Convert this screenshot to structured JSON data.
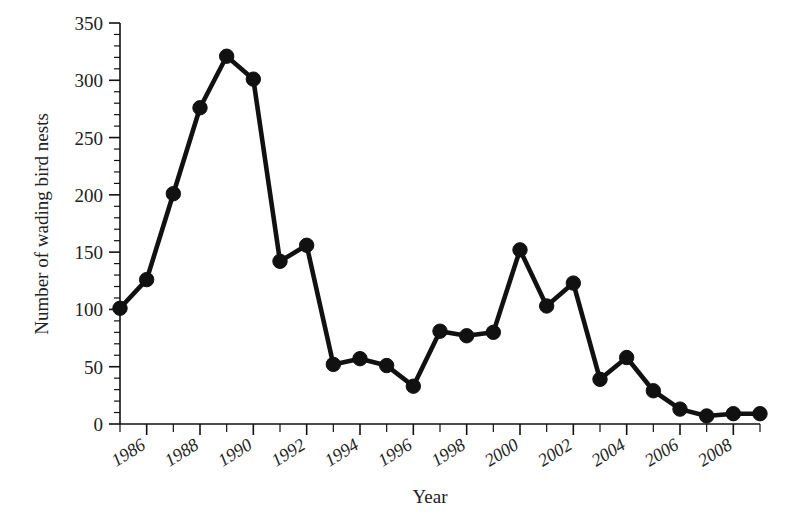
{
  "figure": {
    "background_color": "#ffffff",
    "line_color": "#111111",
    "marker_color": "#111111",
    "text_color": "#222222"
  },
  "axes": {
    "y_title": "Number of wading bird nests",
    "x_title": "Year",
    "y_ticks": [
      "0",
      "50",
      "100",
      "150",
      "200",
      "250",
      "300",
      "350"
    ],
    "x_ticks": [
      "1986",
      "1988",
      "1990",
      "1992",
      "1994",
      "1996",
      "1998",
      "2000",
      "2002",
      "2004",
      "2006",
      "2008"
    ]
  },
  "chart_data": {
    "type": "line",
    "title": "",
    "xlabel": "Year",
    "ylabel": "Number of wading bird nests",
    "xlim": [
      1985,
      2009
    ],
    "ylim": [
      0,
      350
    ],
    "grid": false,
    "legend": null,
    "marker": "filled-circle",
    "x": [
      1985,
      1986,
      1987,
      1988,
      1989,
      1990,
      1991,
      1992,
      1993,
      1994,
      1995,
      1996,
      1997,
      1998,
      1999,
      2000,
      2001,
      2002,
      2003,
      2004,
      2005,
      2006,
      2007,
      2008,
      2009
    ],
    "values": [
      101,
      126,
      201,
      276,
      321,
      301,
      142,
      156,
      52,
      57,
      51,
      33,
      81,
      77,
      80,
      152,
      103,
      123,
      39,
      58,
      29,
      13,
      7,
      9,
      9
    ],
    "points": [
      {
        "year": 1985,
        "nests": 101
      },
      {
        "year": 1986,
        "nests": 126
      },
      {
        "year": 1987,
        "nests": 201
      },
      {
        "year": 1988,
        "nests": 276
      },
      {
        "year": 1989,
        "nests": 321
      },
      {
        "year": 1990,
        "nests": 301
      },
      {
        "year": 1991,
        "nests": 142
      },
      {
        "year": 1992,
        "nests": 156
      },
      {
        "year": 1993,
        "nests": 52
      },
      {
        "year": 1994,
        "nests": 57
      },
      {
        "year": 1995,
        "nests": 51
      },
      {
        "year": 1996,
        "nests": 33
      },
      {
        "year": 1997,
        "nests": 81
      },
      {
        "year": 1998,
        "nests": 77
      },
      {
        "year": 1999,
        "nests": 80
      },
      {
        "year": 2000,
        "nests": 152
      },
      {
        "year": 2001,
        "nests": 103
      },
      {
        "year": 2002,
        "nests": 123
      },
      {
        "year": 2003,
        "nests": 39
      },
      {
        "year": 2004,
        "nests": 58
      },
      {
        "year": 2005,
        "nests": 29
      },
      {
        "year": 2006,
        "nests": 13
      },
      {
        "year": 2007,
        "nests": 7
      },
      {
        "year": 2008,
        "nests": 9
      }
    ]
  }
}
